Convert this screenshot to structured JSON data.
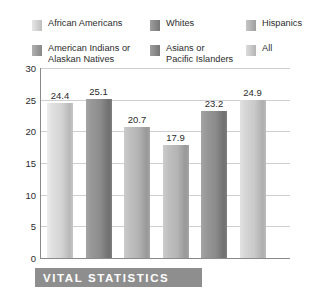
{
  "legend": {
    "rows": [
      [
        {
          "label": "African Americans",
          "color": "#d4d4d4"
        },
        {
          "label": "Whites",
          "color": "#8c8c8c"
        },
        {
          "label": "Hispanics",
          "color": "#b4b4b4"
        }
      ],
      [
        {
          "label": "American Indians or\nAlaskan Natives",
          "color": "#9e9e9e"
        },
        {
          "label": "Asians or\nPacific Islanders",
          "color": "#8c8c8c"
        },
        {
          "label": "All",
          "color": "#cacaca"
        }
      ]
    ]
  },
  "footer": {
    "title": "VITAL STATISTICS",
    "background": "#8e8e8e",
    "text_color": "#ffffff"
  },
  "chart_data": {
    "type": "bar",
    "title": "",
    "xlabel": "",
    "ylabel": "",
    "ylim": [
      0,
      30
    ],
    "yticks": [
      0,
      5,
      10,
      15,
      20,
      25,
      30
    ],
    "ytick_labels": [
      "0",
      "5",
      "10",
      "15",
      "20",
      "25",
      "30"
    ],
    "grid": true,
    "legend_position": "top",
    "categories": [
      "African Americans",
      "Whites",
      "Hispanics",
      "American Indians or Alaskan Natives",
      "Asians or Pacific Islanders",
      "All"
    ],
    "values": [
      24.4,
      25.1,
      20.7,
      17.9,
      23.2,
      24.9
    ],
    "value_labels": [
      "24.4",
      "25.1",
      "20.7",
      "17.9",
      "23.2",
      "24.9"
    ],
    "bar_colors": [
      "#d4d4d4",
      "#8c8c8c",
      "#b4b4b4",
      "#b4b4b4",
      "#8c8c8c",
      "#cacaca"
    ]
  }
}
